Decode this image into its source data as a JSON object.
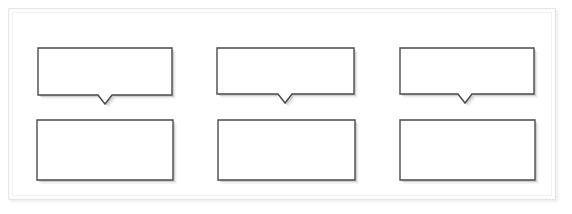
{
  "document": {
    "title": "Blank callout diagram",
    "background_color": "#ffffff",
    "frame": {
      "border_color": "#e6e6e6",
      "fill_color": "#ffffff",
      "x": 8,
      "y": 8,
      "width": 548,
      "height": 192
    }
  },
  "style": {
    "shape_fill": "#ffffff",
    "shape_border": "#4a4a4a",
    "shadow_color": "#b9b9b9"
  },
  "shapes": [
    {
      "id": "callout-1",
      "kind": "rounded-callout-down",
      "row": "top",
      "column": 1,
      "text": "",
      "x": 38,
      "y": 48,
      "width": 134,
      "height": 47,
      "tail": {
        "center_x": 67,
        "width": 14,
        "depth": 9
      }
    },
    {
      "id": "callout-2",
      "kind": "rounded-callout-down",
      "row": "top",
      "column": 2,
      "text": "",
      "x": 217,
      "y": 48,
      "width": 137,
      "height": 46,
      "tail": {
        "center_x": 68,
        "width": 14,
        "depth": 9
      }
    },
    {
      "id": "callout-3",
      "kind": "rounded-callout-down",
      "row": "top",
      "column": 3,
      "text": "",
      "x": 400,
      "y": 48,
      "width": 134,
      "height": 46,
      "tail": {
        "center_x": 65,
        "width": 14,
        "depth": 9
      }
    },
    {
      "id": "rect-1",
      "kind": "rectangle",
      "row": "bottom",
      "column": 1,
      "text": "",
      "x": 37,
      "y": 120,
      "width": 136,
      "height": 60
    },
    {
      "id": "rect-2",
      "kind": "rectangle",
      "row": "bottom",
      "column": 2,
      "text": "",
      "x": 218,
      "y": 120,
      "width": 137,
      "height": 60
    },
    {
      "id": "rect-3",
      "kind": "rectangle",
      "row": "bottom",
      "column": 3,
      "text": "",
      "x": 400,
      "y": 120,
      "width": 135,
      "height": 60
    }
  ]
}
